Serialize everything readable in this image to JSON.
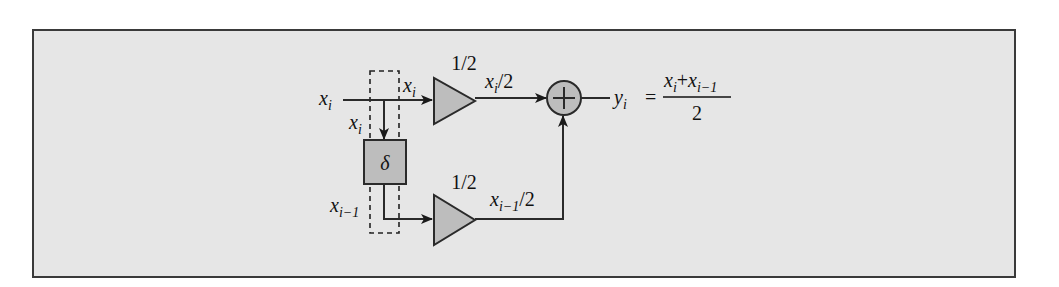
{
  "diagram": {
    "type": "signal-flow block diagram",
    "colors": {
      "background": "#e6e6e6",
      "frame_border": "#3a3a3a",
      "block_fill": "#bdbdbd",
      "line": "#2a2a2a",
      "text": "#111111"
    },
    "input": {
      "label_main": "x",
      "label_sub": "i"
    },
    "branch_top": {
      "label_main": "x",
      "label_sub": "i"
    },
    "branch_down": {
      "label_main": "x",
      "label_sub": "i"
    },
    "delay_block": {
      "symbol": "δ",
      "output_label_main": "x",
      "output_label_sub": "i−1"
    },
    "gain_top": {
      "gain_label": "1/2",
      "output_label_main": "x",
      "output_label_sub": "i",
      "output_label_suffix": "/2"
    },
    "gain_bottom": {
      "gain_label": "1/2",
      "output_label_main": "x",
      "output_label_sub": "i−1",
      "output_label_suffix": "/2"
    },
    "summer": {
      "symbol": "+"
    },
    "output": {
      "label_main": "y",
      "label_sub": "i",
      "equals": "=",
      "numerator_a_main": "x",
      "numerator_a_sub": "i",
      "plus": "+",
      "numerator_b_main": "x",
      "numerator_b_sub": "i−1",
      "denominator": "2"
    }
  }
}
